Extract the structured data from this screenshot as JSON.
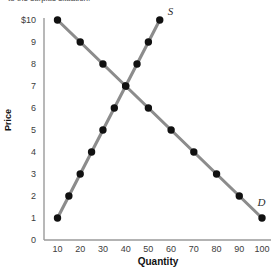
{
  "caption": {
    "fragment": "to the surplus situation."
  },
  "chart_data": {
    "type": "line",
    "title": "",
    "xlabel": "Quantity",
    "ylabel": "Price",
    "xlim": [
      0,
      105
    ],
    "ylim": [
      0,
      10.6
    ],
    "grid": false,
    "legend_position": "inline-curve-end",
    "x_ticks": [
      "10",
      "20",
      "30",
      "40",
      "50",
      "60",
      "70",
      "80",
      "90",
      "100"
    ],
    "x_tick_values": [
      10,
      20,
      30,
      40,
      50,
      60,
      70,
      80,
      90,
      100
    ],
    "y_ticks": [
      "0",
      "1",
      "2",
      "3",
      "4",
      "5",
      "6",
      "7",
      "8",
      "9",
      "$10"
    ],
    "y_tick_values": [
      0,
      1,
      2,
      3,
      4,
      5,
      6,
      7,
      8,
      9,
      10
    ],
    "marker": "filled-circle",
    "marker_color": "#111111",
    "line_color": "#8c8c8c",
    "axis_color": "#9a9a9a",
    "series": [
      {
        "name": "D",
        "label": "D",
        "label_x": 98,
        "label_y": 1.75,
        "points": [
          {
            "x": 10,
            "y": 10
          },
          {
            "x": 20,
            "y": 9
          },
          {
            "x": 30,
            "y": 8
          },
          {
            "x": 40,
            "y": 7
          },
          {
            "x": 50,
            "y": 6
          },
          {
            "x": 60,
            "y": 5
          },
          {
            "x": 70,
            "y": 4
          },
          {
            "x": 80,
            "y": 3
          },
          {
            "x": 90,
            "y": 2
          },
          {
            "x": 100,
            "y": 1
          }
        ]
      },
      {
        "name": "S",
        "label": "S",
        "label_x": 58.5,
        "label_y": 10.4,
        "points": [
          {
            "x": 10,
            "y": 1
          },
          {
            "x": 15,
            "y": 2
          },
          {
            "x": 20,
            "y": 3
          },
          {
            "x": 25,
            "y": 4
          },
          {
            "x": 30,
            "y": 5
          },
          {
            "x": 35,
            "y": 6
          },
          {
            "x": 40,
            "y": 7
          },
          {
            "x": 45,
            "y": 8
          },
          {
            "x": 50,
            "y": 9
          },
          {
            "x": 55,
            "y": 10
          }
        ]
      }
    ],
    "equilibrium": {
      "x": 40,
      "y": 7
    }
  }
}
